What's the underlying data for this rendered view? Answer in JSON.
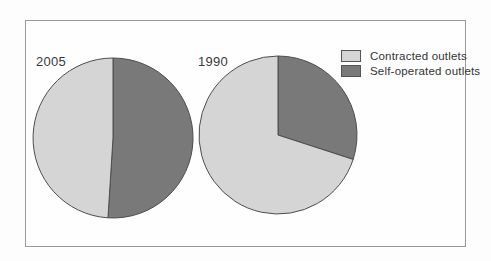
{
  "figure": {
    "background": "#fdfdfd",
    "frame_border_color": "#9a9a9a"
  },
  "style": {
    "light_fill": "#d5d5d5",
    "dark_fill": "#797979",
    "outline_color": "#4d4d4d",
    "text_color": "#333333"
  },
  "legend": {
    "position": "top-right",
    "items": [
      {
        "label": "Contracted outlets",
        "color": "#d5d5d5"
      },
      {
        "label": "Self-operated outlets",
        "color": "#797979"
      }
    ]
  },
  "chart_data": [
    {
      "type": "pie",
      "title": "2005",
      "start_angle_deg": 0,
      "direction": "clockwise",
      "slices": [
        {
          "label": "Self-operated outlets",
          "value": 51,
          "color": "#797979"
        },
        {
          "label": "Contracted outlets",
          "value": 49,
          "color": "#d5d5d5"
        }
      ]
    },
    {
      "type": "pie",
      "title": "1990",
      "start_angle_deg": 0,
      "direction": "clockwise",
      "slices": [
        {
          "label": "Self-operated outlets",
          "value": 30,
          "color": "#797979"
        },
        {
          "label": "Contracted outlets",
          "value": 70,
          "color": "#d5d5d5"
        }
      ]
    }
  ]
}
